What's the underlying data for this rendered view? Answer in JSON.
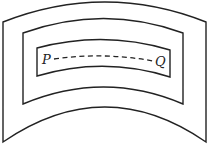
{
  "diagram": {
    "points": [
      {
        "id": "P",
        "label": "P"
      },
      {
        "id": "Q",
        "label": "Q"
      }
    ],
    "regions": [
      "outer",
      "middle",
      "inner"
    ],
    "stroke_color": "#222222",
    "background": "#ffffff"
  }
}
